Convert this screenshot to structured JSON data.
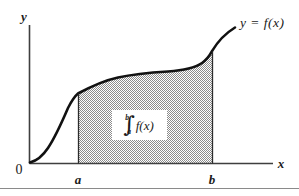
{
  "figure": {
    "background_color": "#ffffff",
    "axes": {
      "y_axis_label": "y",
      "x_axis_label": "x",
      "origin_label": "0",
      "axis_color": "#3a3a3a"
    },
    "curve": {
      "label": "y  =  f(x)",
      "color": "#111111",
      "shape": "sigmoid-then-rising"
    },
    "bounds": {
      "lower_label": "a",
      "upper_label": "b",
      "lower_x": 78,
      "upper_x": 212
    },
    "shaded_region": {
      "fill_description": "50% dither gray",
      "fill_color": "#9a9a9a"
    },
    "integral_annotation": {
      "upper_limit": "b",
      "lower_limit": "a",
      "integral_sign": "∫",
      "integrand": "f(x)"
    }
  }
}
